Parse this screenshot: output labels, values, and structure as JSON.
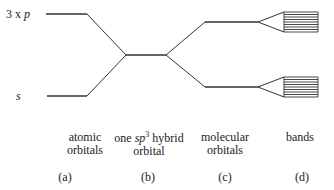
{
  "diagram": {
    "type": "orbital-energy-level-diagram",
    "level_labels": {
      "p": {
        "prefix": "3 x ",
        "symbol": "p"
      },
      "s": {
        "symbol": "s"
      }
    },
    "columns": [
      {
        "id": "a",
        "line1": "atomic",
        "line2": "orbitals",
        "tag": "(a)"
      },
      {
        "id": "b",
        "line1_pre": "one ",
        "line1_sym": "sp",
        "line1_sup": "3",
        "line1_post": " hybrid",
        "line2": "orbital",
        "tag": "(b)"
      },
      {
        "id": "c",
        "line1": "molecular",
        "line2": "orbitals",
        "tag": "(c)"
      },
      {
        "id": "d",
        "line1": "bands",
        "line2": "",
        "tag": "(d)"
      }
    ],
    "colors": {
      "line": "#333333",
      "text": "#222222"
    }
  }
}
